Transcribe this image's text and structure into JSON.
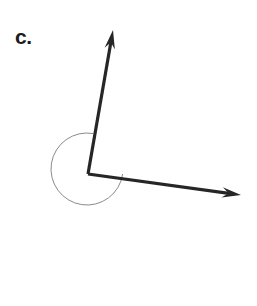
{
  "figure": {
    "label": "c.",
    "background_color": "#ffffff",
    "ray_color": "#262626",
    "arc_color": "#8a8a8a",
    "label_color": "#1c1c1c"
  },
  "chart_data": {
    "type": "diagram",
    "title": "c.",
    "subtitle": "",
    "xlabel": "",
    "ylabel": "",
    "canvas": {
      "width": 257,
      "height": 306
    },
    "vertex": {
      "x": 88,
      "y": 174
    },
    "rays": [
      {
        "name": "upward-ray",
        "from": {
          "x": 88,
          "y": 174
        },
        "to": {
          "x": 113,
          "y": 30
        },
        "arrowhead": true,
        "angle_degrees": 80,
        "stroke_width": 3.2,
        "color": "#262626"
      },
      {
        "name": "right-down-ray",
        "from": {
          "x": 88,
          "y": 174
        },
        "to": {
          "x": 241,
          "y": 195
        },
        "arrowhead": true,
        "angle_degrees": -7.8,
        "stroke_width": 3.2,
        "color": "#262626"
      }
    ],
    "arc": {
      "name": "reflex-angle-arc",
      "center": {
        "x": 87,
        "y": 169
      },
      "radius": 36,
      "start_angle_degrees": -8,
      "end_angle_degrees": 80,
      "sweep": "reflex",
      "sweep_degrees": 272,
      "stroke_width": 1,
      "color": "#8a8a8a"
    },
    "measured_angle_degrees": 272,
    "legend": [],
    "grid": false
  }
}
